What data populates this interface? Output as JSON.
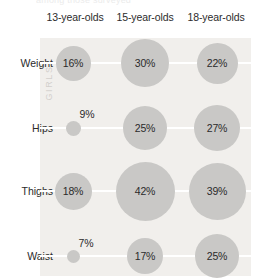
{
  "top_cut_text": "among those surveyed",
  "group_caption": "GIRLS",
  "colors": {
    "panel_background": "#f1efec",
    "bubble_fill": "#c9c8c6",
    "gridline": "#ffffff",
    "text": "#2b2b2b",
    "caption": "#d3d0cc"
  },
  "chart_data": {
    "type": "scatter",
    "title": "",
    "subtitle": "",
    "xlabel": "",
    "ylabel": "",
    "grid": true,
    "legend": "none",
    "value_unit": "%",
    "group": "GIRLS",
    "categories": [
      "13-year-olds",
      "15-year-olds",
      "18-year-olds"
    ],
    "rows": [
      "Weight",
      "Hips",
      "Thighs",
      "Waist"
    ],
    "series": [
      {
        "name": "Weight",
        "values": [
          16,
          30,
          22
        ],
        "labels": [
          "16%",
          "30%",
          "22%"
        ]
      },
      {
        "name": "Hips",
        "values": [
          9,
          25,
          27
        ],
        "labels": [
          "9%",
          "25%",
          "27%"
        ]
      },
      {
        "name": "Thighs",
        "values": [
          18,
          42,
          39
        ],
        "labels": [
          "18%",
          "42%",
          "39%"
        ]
      },
      {
        "name": "Waist",
        "values": [
          7,
          17,
          25
        ],
        "labels": [
          "7%",
          "17%",
          "25%"
        ]
      }
    ],
    "bubbles": [
      {
        "row": "Weight",
        "category": "13-year-olds",
        "value": 16,
        "label": "16%",
        "cx": 73,
        "cy": 63,
        "r": 17.5,
        "label_position": "inside"
      },
      {
        "row": "Weight",
        "category": "15-year-olds",
        "value": 30,
        "label": "30%",
        "cx": 145,
        "cy": 63,
        "r": 24.0,
        "label_position": "inside"
      },
      {
        "row": "Weight",
        "category": "18-year-olds",
        "value": 22,
        "label": "22%",
        "cx": 217,
        "cy": 63,
        "r": 20.5,
        "label_position": "inside"
      },
      {
        "row": "Hips",
        "category": "13-year-olds",
        "value": 9,
        "label": "9%",
        "cx": 73,
        "cy": 128,
        "r": 7.5,
        "label_position": "above-right"
      },
      {
        "row": "Hips",
        "category": "15-year-olds",
        "value": 25,
        "label": "25%",
        "cx": 145,
        "cy": 128,
        "r": 22.0,
        "label_position": "inside"
      },
      {
        "row": "Hips",
        "category": "18-year-olds",
        "value": 27,
        "label": "27%",
        "cx": 217,
        "cy": 128,
        "r": 23.0,
        "label_position": "inside"
      },
      {
        "row": "Thighs",
        "category": "13-year-olds",
        "value": 18,
        "label": "18%",
        "cx": 73,
        "cy": 191,
        "r": 18.5,
        "label_position": "inside"
      },
      {
        "row": "Thighs",
        "category": "15-year-olds",
        "value": 42,
        "label": "42%",
        "cx": 145,
        "cy": 191,
        "r": 29.5,
        "label_position": "inside"
      },
      {
        "row": "Thighs",
        "category": "18-year-olds",
        "value": 39,
        "label": "39%",
        "cx": 217,
        "cy": 191,
        "r": 28.5,
        "label_position": "inside"
      },
      {
        "row": "Waist",
        "category": "13-year-olds",
        "value": 7,
        "label": "7%",
        "cx": 73,
        "cy": 256,
        "r": 6.5,
        "label_position": "above-right"
      },
      {
        "row": "Waist",
        "category": "15-year-olds",
        "value": 17,
        "label": "17%",
        "cx": 145,
        "cy": 256,
        "r": 18.0,
        "label_position": "inside"
      },
      {
        "row": "Waist",
        "category": "18-year-olds",
        "value": 25,
        "label": "25%",
        "cx": 217,
        "cy": 256,
        "r": 22.0,
        "label_position": "inside"
      }
    ]
  }
}
